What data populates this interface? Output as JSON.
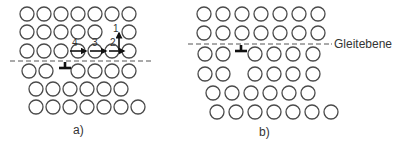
{
  "figure": {
    "panels": [
      {
        "id": "a",
        "caption": "a)",
        "caption_pos": [
          79,
          134
        ],
        "atom_radius": 7,
        "rows": [
          {
            "y": 14,
            "x": [
              27,
              44,
              61,
              78,
              95,
              112,
              129
            ]
          },
          {
            "y": 32,
            "x": [
              27,
              44,
              61,
              78,
              95,
              129
            ]
          },
          {
            "y": 51,
            "x": [
              27,
              44,
              61,
              78,
              95,
              112,
              129
            ]
          },
          {
            "y": 71,
            "x": [
              29,
              46,
              78,
              95,
              112,
              129
            ]
          },
          {
            "y": 89,
            "x": [
              36,
              53,
              70,
              87,
              104,
              121
            ]
          },
          {
            "y": 107,
            "x": [
              36,
              53,
              70,
              87,
              104,
              121,
              138
            ]
          }
        ],
        "glide_plane": {
          "x1": 10,
          "x2": 152,
          "y": 61
        },
        "dislocation": {
          "x": 65,
          "y": 61
        },
        "arrows": [
          {
            "label": "4",
            "x1": 70,
            "y1": 51,
            "x2": 86,
            "y2": 51,
            "lx": 72,
            "ly": 46
          },
          {
            "label": "3",
            "x1": 90,
            "y1": 51,
            "x2": 106,
            "y2": 51,
            "lx": 92,
            "ly": 46
          },
          {
            "label": "2",
            "x1": 109,
            "y1": 51,
            "x2": 124,
            "y2": 51,
            "lx": 110,
            "ly": 46
          },
          {
            "label": "1",
            "x1": 119,
            "y1": 50,
            "x2": 119,
            "y2": 33,
            "lx": 113,
            "ly": 32
          }
        ]
      },
      {
        "id": "b",
        "caption": "b)",
        "caption_pos": [
          265,
          136
        ],
        "atom_radius": 7,
        "rows": [
          {
            "y": 14,
            "x": [
              204,
              223,
              242,
              261,
              280,
              299,
              318
            ]
          },
          {
            "y": 33,
            "x": [
              204,
              223,
              242,
              261,
              280,
              299,
              318
            ]
          },
          {
            "y": 54,
            "x": [
              205,
              223,
              255,
              274,
              293,
              313
            ]
          },
          {
            "y": 74,
            "x": [
              205,
              223,
              255,
              274,
              293,
              313
            ]
          },
          {
            "y": 93,
            "x": [
              213,
              232,
              251,
              270,
              289,
              308
            ]
          },
          {
            "y": 112,
            "x": [
              217,
              236,
              255,
              274,
              293,
              312,
              331
            ]
          }
        ],
        "glide_plane": {
          "x1": 188,
          "x2": 331,
          "y": 44
        },
        "dislocation": {
          "x": 241,
          "y": 44
        },
        "plane_label": {
          "text": "Gleitebene",
          "x": 334,
          "y": 48
        },
        "arrows": []
      }
    ]
  }
}
